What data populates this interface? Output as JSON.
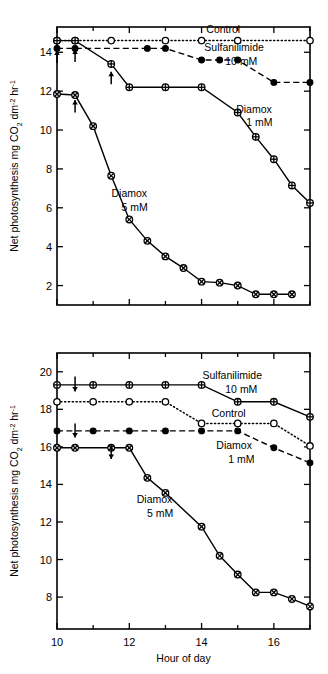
{
  "figure": {
    "background_color": "#ffffff",
    "ink_color": "#000000"
  },
  "axis_titles": {
    "y_parts": {
      "main": "Net photosynthesis",
      "units_mg": "mg CO",
      "units_sub2": "2",
      "units_dm": " dm",
      "units_sup_minus2": "-2",
      "units_hr": " hr",
      "units_sup_minus1": "-1"
    },
    "x": "Hour of day"
  },
  "chart_data": [
    {
      "type": "line",
      "panel": "top",
      "title": "",
      "xlabel": "",
      "ylabel": "Net photosynthesis  mg CO2 dm-2 hr-1",
      "xlim": [
        10,
        17
      ],
      "ylim": [
        1.0,
        15.3
      ],
      "x_ticks_major": [
        10,
        12,
        14,
        16
      ],
      "x_ticks_minor": [
        11,
        13,
        15,
        17
      ],
      "y_ticks_major": [
        2,
        4,
        6,
        8,
        10,
        12,
        14
      ],
      "grid": false,
      "legend_position": "inline-annotations",
      "annotations": [
        {
          "text": "Control",
          "x": 14.6,
          "y": 15.0
        },
        {
          "text": "Sulfanilimide",
          "x": 14.9,
          "y": 14.05
        },
        {
          "text": "10 mM",
          "x": 15.1,
          "y": 13.35
        },
        {
          "text": "Diamox",
          "x": 15.45,
          "y": 10.9
        },
        {
          "text": "1 mM",
          "x": 15.6,
          "y": 10.2
        },
        {
          "text": "Diamox",
          "x": 12.0,
          "y": 6.55
        },
        {
          "text": "5 mM",
          "x": 12.15,
          "y": 5.85
        }
      ],
      "arrows": [
        {
          "x": 10.0,
          "y_tip": 14.1,
          "y_tail": 13.45
        },
        {
          "x": 10.5,
          "y_tip": 14.15,
          "y_tail": 13.5
        },
        {
          "x": 11.5,
          "y_tip": 13.0,
          "y_tail": 12.35
        },
        {
          "x": 10.5,
          "y_tip": 11.55,
          "y_tail": 10.9
        }
      ],
      "series": [
        {
          "name": "Control",
          "marker": "open-circle",
          "line_style": "dotted",
          "x": [
            10.0,
            10.5,
            11.5,
            13.0,
            14.0,
            15.0,
            17.0
          ],
          "values": [
            14.6,
            14.6,
            14.6,
            14.6,
            14.6,
            14.6,
            14.6
          ]
        },
        {
          "name": "Sulfanilimide 10 mM",
          "marker": "filled-circle",
          "line_style": "dashed",
          "x": [
            10.0,
            10.5,
            12.5,
            13.0,
            14.0,
            14.5,
            15.0,
            16.0,
            17.0
          ],
          "values": [
            14.2,
            14.2,
            14.2,
            14.2,
            13.6,
            13.6,
            13.6,
            12.45,
            12.45
          ]
        },
        {
          "name": "Diamox 1 mM",
          "marker": "crossed-circle-plus",
          "line_style": "solid",
          "x": [
            10.0,
            10.5,
            11.5,
            12.0,
            13.0,
            14.0,
            15.0,
            15.5,
            16.0,
            16.5,
            17.0
          ],
          "values": [
            14.6,
            14.6,
            13.4,
            12.2,
            12.2,
            12.2,
            10.9,
            9.65,
            8.5,
            7.15,
            6.25
          ]
        },
        {
          "name": "Diamox 5 mM",
          "marker": "crossed-circle-x",
          "line_style": "solid",
          "x": [
            10.0,
            10.5,
            11.0,
            11.5,
            12.0,
            12.5,
            13.0,
            13.5,
            14.0,
            14.5,
            15.0,
            15.5,
            16.0,
            16.5
          ],
          "values": [
            11.85,
            11.8,
            10.2,
            7.65,
            5.4,
            4.3,
            3.5,
            2.9,
            2.2,
            2.15,
            2.0,
            1.55,
            1.55,
            1.55
          ]
        }
      ]
    },
    {
      "type": "line",
      "panel": "bottom",
      "title": "",
      "xlabel": "Hour of day",
      "ylabel": "Net photosynthesis  mg CO2 dm-2 hr-1",
      "xlim": [
        10,
        17
      ],
      "ylim": [
        6.3,
        21.0
      ],
      "x_ticks_major": [
        10,
        12,
        14,
        16
      ],
      "x_ticks_minor": [
        11,
        13,
        15,
        17
      ],
      "y_ticks_major": [
        8,
        10,
        12,
        14,
        16,
        18,
        20
      ],
      "grid": false,
      "legend_position": "inline-annotations",
      "annotations": [
        {
          "text": "Sulfanilimide",
          "x": 14.85,
          "y": 19.6
        },
        {
          "text": "10 mM",
          "x": 15.1,
          "y": 18.85
        },
        {
          "text": "Control",
          "x": 14.75,
          "y": 17.6
        },
        {
          "text": "Diamox",
          "x": 14.9,
          "y": 15.9
        },
        {
          "text": "1 mM",
          "x": 15.1,
          "y": 15.15
        },
        {
          "text": "Diamox",
          "x": 12.7,
          "y": 13.0
        },
        {
          "text": "5 mM",
          "x": 12.85,
          "y": 12.25
        }
      ],
      "arrows": [
        {
          "x": 10.5,
          "y_tip": 18.95,
          "y_tail": 19.75
        },
        {
          "x": 10.5,
          "y_tip": 16.5,
          "y_tail": 17.25
        },
        {
          "x": 11.5,
          "y_tip": 15.35,
          "y_tail": 16.1
        }
      ],
      "series": [
        {
          "name": "Sulfanilimide 10 mM",
          "marker": "crossed-circle-plus",
          "line_style": "solid",
          "x": [
            10.0,
            11.0,
            12.0,
            13.0,
            14.0,
            15.0,
            16.0,
            17.0
          ],
          "values": [
            19.3,
            19.3,
            19.3,
            19.3,
            19.3,
            18.4,
            18.4,
            17.6
          ]
        },
        {
          "name": "Control",
          "marker": "open-circle",
          "line_style": "dotted",
          "x": [
            10.0,
            11.0,
            12.0,
            13.0,
            14.0,
            15.0,
            16.0,
            17.0
          ],
          "values": [
            18.4,
            18.4,
            18.4,
            18.4,
            17.25,
            17.25,
            17.25,
            16.05
          ]
        },
        {
          "name": "Diamox 1 mM",
          "marker": "filled-circle",
          "line_style": "dashed",
          "x": [
            10.0,
            11.0,
            12.0,
            13.0,
            14.0,
            15.0,
            16.0,
            17.0
          ],
          "values": [
            16.85,
            16.85,
            16.85,
            16.85,
            16.85,
            16.85,
            15.95,
            15.15
          ]
        },
        {
          "name": "Diamox 5 mM",
          "marker": "crossed-circle-x",
          "line_station": "solid",
          "line_style": "solid",
          "x": [
            10.0,
            10.5,
            11.5,
            12.0,
            12.5,
            13.0,
            14.0,
            14.5,
            15.0,
            15.5,
            16.0,
            16.5,
            17.0
          ],
          "values": [
            15.95,
            15.95,
            15.95,
            15.95,
            14.35,
            13.55,
            11.75,
            10.2,
            9.2,
            8.25,
            8.25,
            7.9,
            7.5
          ]
        }
      ]
    }
  ]
}
